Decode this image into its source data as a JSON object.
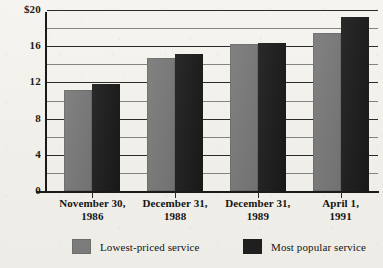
{
  "chart_data": {
    "type": "bar",
    "title": "",
    "subtitle": "",
    "xlabel": "",
    "ylabel": "",
    "ylim": [
      0,
      20
    ],
    "grid": true,
    "grid_major_step": 4,
    "grid_minor_step": 2,
    "legend_position": "bottom",
    "categories": [
      "November 30, 1986",
      "December 31, 1988",
      "December 31, 1989",
      "April 1, 1991"
    ],
    "category_lines": [
      [
        "November 30,",
        "1986"
      ],
      [
        "December 31,",
        "1988"
      ],
      [
        "December 31,",
        "1989"
      ],
      [
        "April 1,",
        "1991"
      ]
    ],
    "ytick_labels": [
      "$20",
      "16",
      "12",
      "8",
      "4",
      "0"
    ],
    "ytick_values": [
      20,
      16,
      12,
      8,
      4,
      0
    ],
    "minor_tick_values": [
      18,
      14,
      10,
      6,
      2
    ],
    "series": [
      {
        "name": "Lowest-priced service",
        "color": "#787878",
        "values": [
          11.2,
          14.7,
          16.2,
          17.5
        ]
      },
      {
        "name": "Most popular service",
        "color": "#1e1e1e",
        "values": [
          11.8,
          15.1,
          16.4,
          19.2
        ]
      }
    ]
  },
  "legend": {
    "items": [
      {
        "label": "Lowest-priced service",
        "color": "#787878"
      },
      {
        "label": "Most popular service",
        "color": "#1e1e1e"
      }
    ]
  }
}
